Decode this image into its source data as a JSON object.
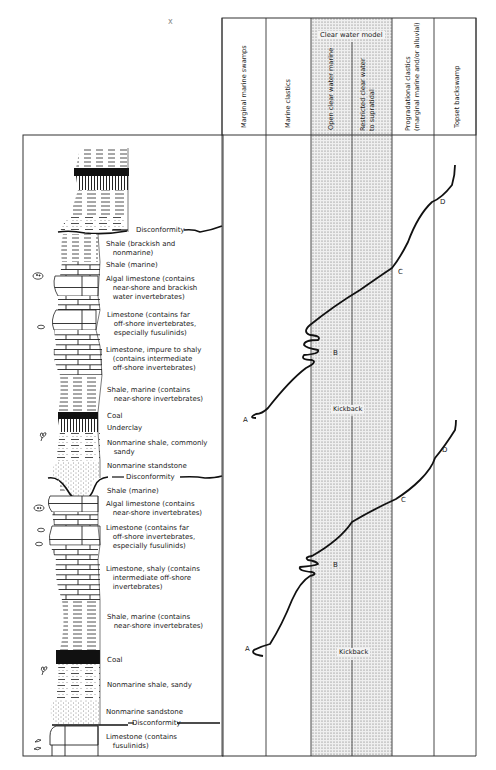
{
  "figure": {
    "stray_mark": "x",
    "column_headers": [
      {
        "id": "marginal-marine-swamps",
        "label": "Marginal marine swamps"
      },
      {
        "id": "marine-clastics",
        "label": "Marine clastics"
      },
      {
        "id": "open-clear-water-marine",
        "label": "Open clear water marine"
      },
      {
        "id": "restricted-clear-water",
        "label_line1": "Restricted clear water",
        "label_line2": "to supratidal"
      },
      {
        "id": "progradational-clastics",
        "label_line1": "Progradational clastics",
        "label_line2": "(marginal marine and/or alluvial)"
      },
      {
        "id": "topset-backswamp",
        "label": "Topset backswamp"
      }
    ],
    "clear_water_model_label": "Clear water model",
    "kickback_labels": [
      "Kickback",
      "Kickback"
    ],
    "curve_points": {
      "upper": [
        "A",
        "B",
        "C",
        "D"
      ],
      "lower": [
        "A",
        "B",
        "C",
        "D"
      ]
    },
    "disconformity_label": "Disconformity",
    "lithology_labels": [
      {
        "text": "Disconformity",
        "y": 230
      },
      {
        "text": "Shale (brackish and\n   nonmarine)",
        "y": 243
      },
      {
        "text": "Shale (marine)",
        "y": 262
      },
      {
        "text": "Algal limestone (contains\n   near-shore and brackish\n   water invertebrates)",
        "y": 276
      },
      {
        "text": "Limestone (contains far\n   off-shore invertebrates,\n   especially fusulinids)",
        "y": 311
      },
      {
        "text": "Limestone, impure to shaly\n   (contains intermediate\n   off-shore invertebrates)",
        "y": 347
      },
      {
        "text": "Shale, marine (contains\n   near-shore invertebrates)",
        "y": 386
      },
      {
        "text": "Coal",
        "y": 415
      },
      {
        "text": "Underclay",
        "y": 427
      },
      {
        "text": "Nonmarine shale, commonly\n   sandy",
        "y": 441
      },
      {
        "text": "Nonmarine standstone",
        "y": 465
      },
      {
        "text": "Disconformity",
        "y": 477
      },
      {
        "text": "Shale (marine)",
        "y": 488
      },
      {
        "text": "Algal limestone (contains\n   near-shore invertebrates)",
        "y": 501
      },
      {
        "text": "Limestone (contains far\n   off-shore invertebrates,\n   especially fusulinids)",
        "y": 524
      },
      {
        "text": "Limestone, shaly (contains\n   intermediate off-shore\n   invertebrates)",
        "y": 565
      },
      {
        "text": "Shale, marine (contains\n   near-shore invertebrates)",
        "y": 615
      },
      {
        "text": "Coal",
        "y": 656
      },
      {
        "text": "Nonmarine shale, sandy",
        "y": 682
      },
      {
        "text": "Nonmarine sandstone",
        "y": 709
      },
      {
        "text": "Disconformity",
        "y": 723
      },
      {
        "text": "Limestone (contains\n   fusulinids)",
        "y": 735
      }
    ],
    "colors": {
      "ink": "#1a1a1a",
      "stipple_bg": "#ececec",
      "stipple_dot": "#6a6a6a",
      "paper": "#ffffff"
    }
  }
}
